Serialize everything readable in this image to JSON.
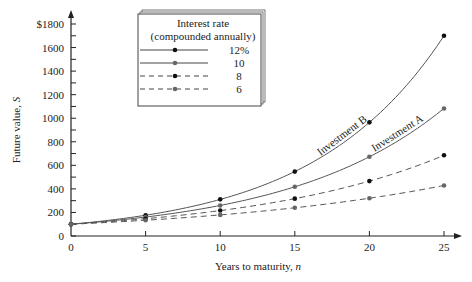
{
  "chart_data": {
    "type": "line",
    "title": "",
    "xlabel": "Years to maturity, n",
    "xlabel_main": "Years to maturity, ",
    "xlabel_var": "n",
    "ylabel": "Future value, S",
    "ylabel_main": "Future value, ",
    "ylabel_var": "S",
    "x": [
      0,
      5,
      10,
      15,
      20,
      25
    ],
    "xticks": [
      "0",
      "5",
      "10",
      "15",
      "20",
      "25"
    ],
    "yticks": [
      "0",
      "200",
      "400",
      "600",
      "800",
      "1000",
      "1200",
      "1400",
      "1600",
      "$1800"
    ],
    "ylim": [
      0,
      1800
    ],
    "xlim": [
      0,
      25
    ],
    "grid": false,
    "legend_position": "upper left (boxed, shadowed)",
    "legend_title": [
      "Interest rate",
      "(compounded annually)"
    ],
    "series": [
      {
        "name": "12%",
        "style": "solid",
        "marker": "black",
        "values": [
          100,
          176,
          311,
          547,
          965,
          1700
        ]
      },
      {
        "name": "10",
        "style": "solid",
        "marker": "gray",
        "values": [
          100,
          161,
          259,
          418,
          673,
          1083
        ]
      },
      {
        "name": "8",
        "style": "dashed",
        "marker": "black",
        "values": [
          100,
          147,
          216,
          317,
          466,
          685
        ]
      },
      {
        "name": "6",
        "style": "dashed",
        "marker": "gray",
        "values": [
          100,
          134,
          179,
          240,
          321,
          429
        ]
      }
    ],
    "annotations": [
      {
        "text": "Investment B",
        "series": "12%",
        "near_x": 17.5
      },
      {
        "text": "Investment A",
        "series": "10",
        "near_x": 21
      }
    ]
  }
}
